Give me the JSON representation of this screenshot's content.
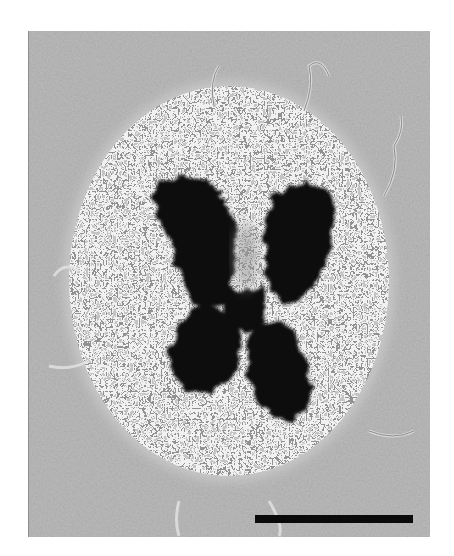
{
  "image": {
    "description": "Phase-contrast micrograph of a metaphase chromosome (X-shaped) with radiating chromatin loops",
    "background_color": "#ffffff",
    "field_color": "#b9b9b9",
    "halo_color": "#d8d8d8",
    "chromosome_color": "#0d0d0d"
  },
  "scale_bar": {
    "color": "#0a0a0a",
    "label": ""
  }
}
